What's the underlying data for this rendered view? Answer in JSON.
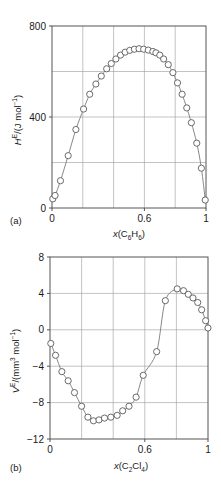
{
  "figure": {
    "caption_a": "(a)",
    "caption_b": "(b)"
  },
  "chart_data": [
    {
      "type": "scatter",
      "panel": "(a)",
      "title": "",
      "xlabel": "x(C6H6)",
      "xlabel_parts": {
        "italic": "x",
        "open": "(C",
        "sub1": "6",
        "mid": "H",
        "sub2": "6",
        "close": ")"
      },
      "ylabel": "H^E/(J mol^-1)",
      "ylabel_parts": {
        "italic": "H",
        "sup": "E",
        "mid": "/(J mol",
        "sup2": "−1",
        "close": ")"
      },
      "xlim": [
        0,
        1
      ],
      "ylim": [
        0,
        800
      ],
      "xticks": [
        0,
        0.6,
        1
      ],
      "xticklabels": [
        "0",
        "0.6",
        "1"
      ],
      "yticks": [
        0,
        400,
        800
      ],
      "yticklabels": [
        "0",
        "400",
        "800"
      ],
      "xgrid": [
        0.2,
        0.4,
        0.6,
        0.8
      ],
      "ygrid": [
        200,
        400,
        600
      ],
      "grid": true,
      "legend": "none",
      "x": [
        0.005,
        0.02,
        0.055,
        0.105,
        0.155,
        0.205,
        0.245,
        0.285,
        0.32,
        0.355,
        0.385,
        0.415,
        0.445,
        0.475,
        0.505,
        0.535,
        0.565,
        0.595,
        0.625,
        0.655,
        0.675,
        0.7,
        0.725,
        0.755,
        0.785,
        0.815,
        0.845,
        0.875,
        0.905,
        0.94,
        0.97,
        0.995
      ],
      "y": [
        40,
        55,
        120,
        230,
        345,
        435,
        500,
        545,
        580,
        612,
        635,
        655,
        672,
        685,
        693,
        698,
        700,
        698,
        694,
        688,
        682,
        672,
        655,
        630,
        595,
        550,
        500,
        440,
        375,
        285,
        175,
        35
      ]
    },
    {
      "type": "scatter",
      "panel": "(b)",
      "title": "",
      "xlabel": "x(C2Cl4)",
      "xlabel_parts": {
        "italic": "x",
        "open": "(C",
        "sub1": "2",
        "mid": "Cl",
        "sub2": "4",
        "close": ")"
      },
      "ylabel": "V^E/(mm^3 mol^-1)",
      "ylabel_parts": {
        "italic": "V",
        "sup": "E",
        "mid": "/(mm",
        "sup2": "3",
        "mid2": " mol",
        "sup3": "−1",
        "close": ")"
      },
      "xlim": [
        0,
        1
      ],
      "ylim": [
        -12,
        8
      ],
      "xticks": [
        0,
        0.6,
        1
      ],
      "xticklabels": [
        "0",
        "0.6",
        "1"
      ],
      "yticks": [
        -12,
        -8,
        -4,
        0,
        4,
        8
      ],
      "yticklabels": [
        "−12",
        "−8",
        "−4",
        "0",
        "4",
        "8"
      ],
      "xgrid": [
        0.2,
        0.4,
        0.6,
        0.8
      ],
      "ygrid": [
        -8,
        -4,
        0,
        4
      ],
      "grid": true,
      "legend": "none",
      "x": [
        0.005,
        0.035,
        0.075,
        0.115,
        0.155,
        0.2,
        0.24,
        0.275,
        0.31,
        0.345,
        0.385,
        0.425,
        0.46,
        0.5,
        0.545,
        0.59,
        0.675,
        0.73,
        0.805,
        0.845,
        0.875,
        0.905,
        0.935,
        0.96,
        0.985,
        1.0
      ],
      "y": [
        -1.5,
        -2.8,
        -4.6,
        -5.6,
        -6.9,
        -8.4,
        -9.6,
        -10.0,
        -9.9,
        -9.7,
        -9.6,
        -9.4,
        -8.9,
        -8.4,
        -7.4,
        -5.0,
        -2.4,
        3.2,
        4.5,
        4.3,
        3.9,
        3.5,
        3.0,
        2.2,
        1.0,
        0.2
      ]
    }
  ]
}
